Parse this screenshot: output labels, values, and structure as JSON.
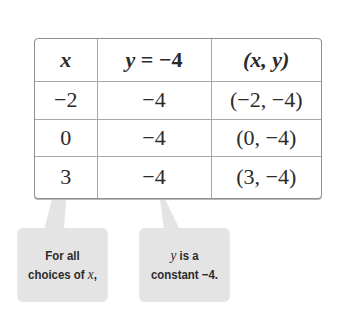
{
  "table": {
    "headers": [
      {
        "label": "x",
        "italic": true
      },
      {
        "label_italic": "y",
        "label_rest": " = −4"
      },
      {
        "label": "(x, y)"
      }
    ],
    "rows": [
      {
        "x": "−2",
        "y": "−4",
        "pair": "(−2, −4)"
      },
      {
        "x": "0",
        "y": "−4",
        "pair": "(0, −4)"
      },
      {
        "x": "3",
        "y": "−4",
        "pair": "(3, −4)"
      }
    ]
  },
  "callouts": [
    {
      "line1": "For all",
      "line2_prefix": "choices of ",
      "line2_var": "x",
      "line2_suffix": ","
    },
    {
      "line1_var": "y",
      "line1_rest": " is a",
      "line2": "constant −4."
    }
  ],
  "colors": {
    "callout_bg": "#e4e4e4",
    "border": "#8e8e8e",
    "text": "#2a2a2a"
  }
}
